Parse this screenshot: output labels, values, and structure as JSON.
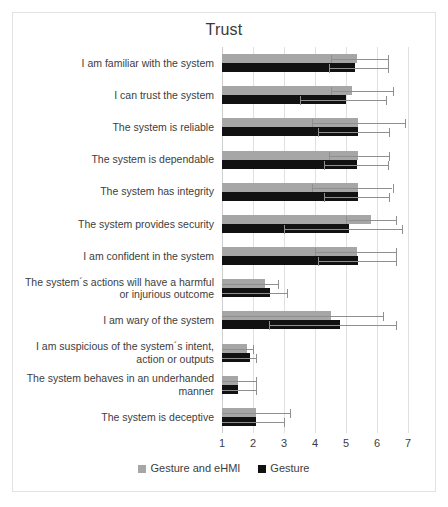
{
  "chart_data": {
    "type": "bar",
    "orientation": "horizontal",
    "title": "Trust",
    "xlabel": "",
    "ylabel": "",
    "xlim": [
      1,
      7
    ],
    "xticks": [
      1,
      2,
      3,
      4,
      5,
      6,
      7
    ],
    "xtick_labels": [
      "1",
      "2",
      "3",
      "4",
      "5",
      "6",
      "7"
    ],
    "grid": true,
    "legend_position": "bottom",
    "categories": [
      "I am familiar with the system",
      "I can trust the system",
      "The system is reliable",
      "The system is dependable",
      "The system has integrity",
      "The system provides security",
      "I am confident in the system",
      "The system´s actions will have a harmful or injurious outcome",
      "I am wary of the system",
      "I am suspicious of the system´s intent, action or outputs",
      "The system behaves in an underhanded manner",
      "The system is deceptive"
    ],
    "series": [
      {
        "name": "Gesture and eHMI",
        "color": "#a6a6a6",
        "values": [
          5.35,
          5.2,
          5.4,
          5.4,
          5.4,
          5.8,
          5.35,
          2.4,
          4.5,
          1.8,
          1.5,
          2.1
        ],
        "errors_low": [
          4.5,
          4.5,
          3.9,
          4.45,
          3.9,
          5.0,
          4.0,
          1.0,
          1.0,
          1.0,
          1.0,
          1.0
        ],
        "errors_high": [
          6.35,
          6.5,
          6.9,
          6.4,
          6.5,
          6.6,
          6.6,
          2.8,
          6.2,
          2.0,
          2.1,
          3.2
        ]
      },
      {
        "name": "Gesture",
        "color": "#111111",
        "values": [
          5.3,
          5.0,
          5.4,
          5.35,
          5.4,
          5.1,
          5.4,
          2.55,
          4.8,
          1.9,
          1.5,
          2.1
        ],
        "errors_low": [
          4.45,
          3.5,
          4.1,
          4.3,
          4.3,
          3.0,
          4.1,
          1.0,
          2.5,
          1.0,
          1.0,
          1.0
        ],
        "errors_high": [
          6.35,
          6.3,
          6.4,
          6.35,
          6.4,
          6.8,
          6.6,
          3.1,
          6.6,
          2.1,
          2.1,
          3.0
        ]
      }
    ]
  },
  "legend": [
    {
      "label": "Gesture and eHMI",
      "color": "#a6a6a6"
    },
    {
      "label": "Gesture",
      "color": "#111111"
    }
  ]
}
